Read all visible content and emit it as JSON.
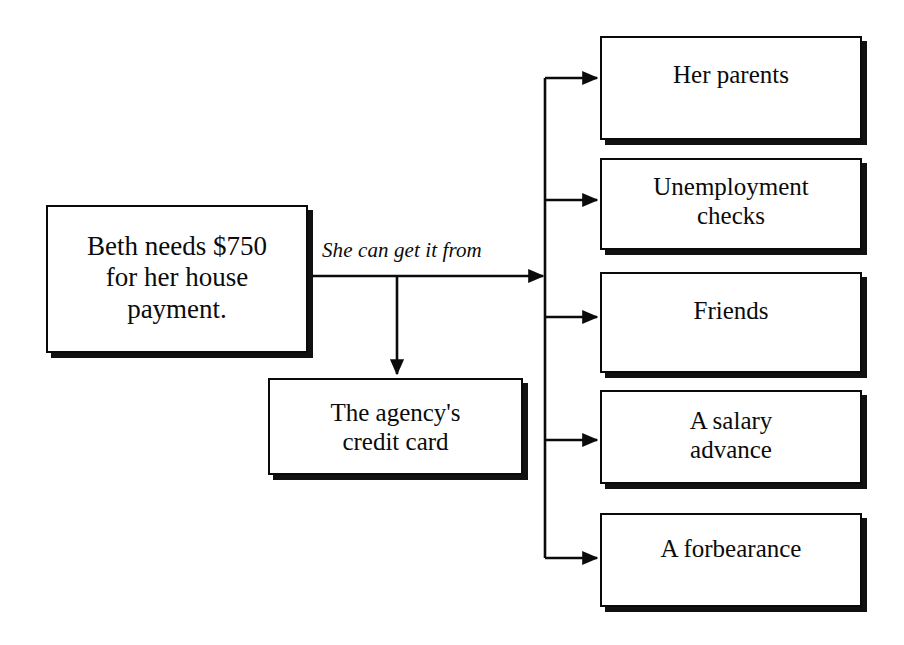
{
  "diagram": {
    "ink_color": "#0b0b0b",
    "background_color": "#ffffff",
    "source_node": {
      "id": "source",
      "text": "Beth needs $750\nfor her house\npayment."
    },
    "edge_label": "She can get it from",
    "secondary_node": {
      "id": "credit-card",
      "text": "The agency's\ncredit card"
    },
    "options": [
      {
        "id": "her-parents",
        "text": "Her parents"
      },
      {
        "id": "unemployment-checks",
        "text": "Unemployment\nchecks"
      },
      {
        "id": "friends",
        "text": "Friends"
      },
      {
        "id": "salary-advance",
        "text": "A salary\nadvance"
      },
      {
        "id": "forbearance",
        "text": "A forbearance"
      }
    ]
  }
}
